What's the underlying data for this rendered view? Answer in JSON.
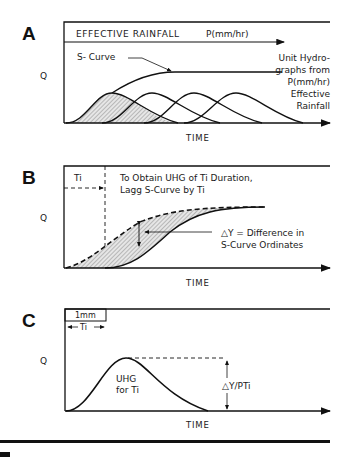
{
  "panels": {
    "a": {
      "letter": "A",
      "rainfall_label": "EFFECTIVE RAINFALL",
      "rainfall_unit": "P(mm/hr)",
      "s_curve_label": "S- Curve",
      "uh_note": [
        "Unit Hydro-",
        "graphs from",
        "P(mm/hr)",
        "Effective",
        "Rainfall"
      ],
      "y_label": "Q",
      "x_label": "TIME"
    },
    "b": {
      "letter": "B",
      "ti_label": "Ti",
      "note": [
        "To Obtain UHG of Ti Duration,",
        "Lagg S-Curve by Ti"
      ],
      "delta_note": [
        "△Y = Difference in",
        "S-Curve Ordinates"
      ],
      "y_label": "Q",
      "x_label": "TIME"
    },
    "c": {
      "letter": "C",
      "box_label": "1mm",
      "ti_label": "Ti",
      "uhg_label": [
        "UHG",
        "for Ti"
      ],
      "ratio_label": "△Y/PTi",
      "y_label": "Q",
      "x_label": "TIME"
    }
  },
  "colors": {
    "ink": "#111111",
    "hatch": "#bdbdbd"
  }
}
